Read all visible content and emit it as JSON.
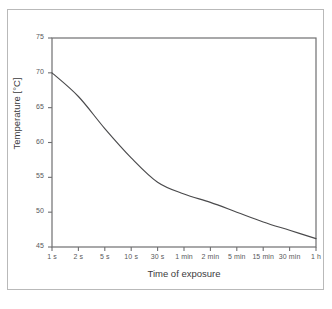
{
  "chart_data": {
    "type": "line",
    "title": "",
    "xlabel": "Time of exposure",
    "ylabel": "Temperature [°C]",
    "x_tick_labels": [
      "1 s",
      "2 s",
      "5 s",
      "10 s",
      "30 s",
      "1 min",
      "2 min",
      "5 min",
      "15 min",
      "30 min",
      "1 h"
    ],
    "y_tick_labels": [
      "45",
      "50",
      "55",
      "60",
      "65",
      "70",
      "75"
    ],
    "y_ticks": [
      45,
      50,
      55,
      60,
      65,
      70,
      75
    ],
    "ylim": [
      45,
      75
    ],
    "x_scale": "categorical-logarithmic",
    "grid": false,
    "legend": null,
    "series": [
      {
        "name": "Safe contact temperature",
        "categories": [
          "1 s",
          "2 s",
          "5 s",
          "10 s",
          "30 s",
          "1 min",
          "2 min",
          "5 min",
          "15 min",
          "30 min",
          "1 h"
        ],
        "values": [
          70.0,
          66.6,
          62.0,
          57.8,
          54.3,
          52.6,
          51.4,
          50.0,
          48.6,
          47.4,
          46.2
        ],
        "color": "#4a4a4c",
        "line_width": 1
      }
    ],
    "axis_color": "#6f6f71",
    "frame_color": "#b9b9b9",
    "background": "#ffffff"
  }
}
